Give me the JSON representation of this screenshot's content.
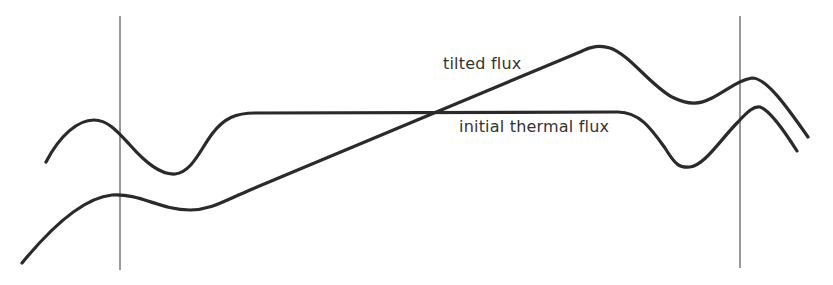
{
  "diagram": {
    "labels": {
      "tilted": "tilted flux",
      "initial": "initial thermal flux"
    },
    "colors": {
      "curve": "#2a2a2a",
      "boundary_line": "#555555",
      "background": "#ffffff"
    },
    "curves": [
      {
        "name": "tilted flux",
        "description": "line rising diagonally from lower left, peaking near right, then oscillating"
      },
      {
        "name": "initial thermal flux",
        "description": "wavy at edges with a long flat plateau in the middle"
      }
    ],
    "boundaries": [
      {
        "name": "left boundary",
        "x": 120
      },
      {
        "name": "right boundary",
        "x": 740
      }
    ]
  }
}
